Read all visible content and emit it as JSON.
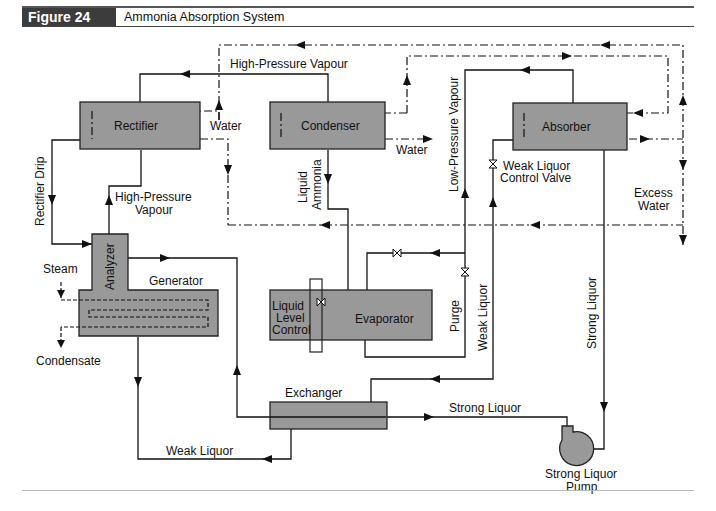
{
  "header": {
    "figure_label": "Figure 24",
    "title": "Ammonia Absorption System"
  },
  "units": {
    "rectifier": "Rectifier",
    "condenser": "Condenser",
    "absorber": "Absorber",
    "analyzer": "Analyzer",
    "generator": "Generator",
    "evaporator": "Evaporator",
    "exchanger": "Exchanger",
    "pump_line1": "Strong Liquor",
    "pump_line2": "Pump"
  },
  "labels": {
    "high_pressure_vapour_top": "High-Pressure Vapour",
    "water_rectifier": "Water",
    "water_condenser": "Water",
    "rectifier_drip": "Rectifier Drip",
    "hp_vapour_line1": "High-Pressure",
    "hp_vapour_line2": "Vapour",
    "liquid_ammonia_line1": "Liquid",
    "liquid_ammonia_line2": "Ammonia",
    "low_pressure_vapour": "Low-Pressure Vapour",
    "weak_liquor_valve_line1": "Weak Liquor",
    "weak_liquor_valve_line2": "Control Valve",
    "excess_water_line1": "Excess",
    "excess_water_line2": "Water",
    "steam": "Steam",
    "condensate": "Condensate",
    "liquid_level_line1": "Liquid",
    "liquid_level_line2": "Level",
    "liquid_level_line3": "Control",
    "purge": "Purge",
    "weak_liquor_vertical": "Weak Liquor",
    "strong_liquor_vertical": "Strong Liquor",
    "strong_liquor_horizontal": "Strong Liquor",
    "weak_liquor_bottom": "Weak Liquor"
  },
  "colors": {
    "unit_fill": "#999999",
    "header_tag_bg": "#3c3c3c",
    "line": "#111111"
  }
}
